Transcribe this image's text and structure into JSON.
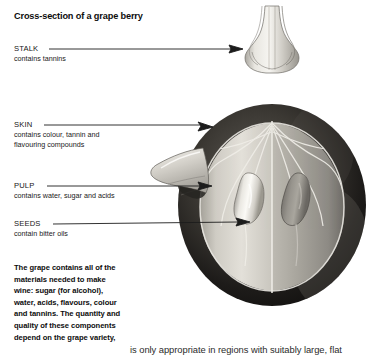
{
  "figure": {
    "title": "Cross-section of a grape berry",
    "callouts": [
      {
        "id": "stalk",
        "term": "STALK",
        "description": "contains tannins"
      },
      {
        "id": "skin",
        "term": "SKIN",
        "description_line_1": "contains colour, tannin and",
        "description_line_2": "flavouring compounds"
      },
      {
        "id": "pulp",
        "term": "PULP",
        "description": "contains water, sugar and acids"
      },
      {
        "id": "seeds",
        "term": "SEEDS",
        "description": "contain bitter oils"
      }
    ],
    "summary": {
      "line_1": "The grape contains all of the",
      "line_2": "materials needed to make",
      "line_3": "wine: sugar (for alcohol),",
      "line_4": "water, acids, flavours, colour",
      "line_5": "and tannins. The quantity and",
      "line_6": "quality of these components",
      "line_7": "depend on the grape variety,"
    }
  },
  "page_body": {
    "clipped_line": "is only appropriate in regions with suitably large, flat"
  },
  "palette": {
    "page_background": "#ffffff",
    "text": "#111111",
    "leader_line": "#1c1c1c",
    "skin_dark": "#151515",
    "skin_mid": "#3a3a3a",
    "pulp_light": "#d7d4cd",
    "pulp_mid": "#b4b1aa",
    "pulp_shadow": "#8e8b85",
    "seed_light": "#f2f0ea",
    "seed_shadow": "#8a8781",
    "stalk_light": "#e6e4de",
    "stalk_mid": "#b9b6af"
  }
}
